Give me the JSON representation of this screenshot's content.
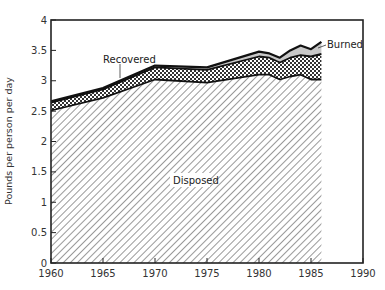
{
  "chart_data": {
    "type": "area",
    "stacked": true,
    "title": "",
    "xlabel": "",
    "ylabel": "Pounds per person per day",
    "xlim": [
      1960,
      1990
    ],
    "ylim": [
      0,
      4
    ],
    "x_ticks": [
      "1960",
      "1965",
      "1970",
      "1975",
      "1980",
      "1985",
      "1990"
    ],
    "y_ticks": [
      "0",
      "0.5",
      "1",
      "1.5",
      "2",
      "2.5",
      "3",
      "3.5",
      "4"
    ],
    "grid": false,
    "legend": "inline labels",
    "x": [
      1960,
      1965,
      1970,
      1975,
      1980,
      1981,
      1982,
      1983,
      1984,
      1985,
      1986
    ],
    "series": [
      {
        "name": "Disposed",
        "pattern": "diagonal-hatch",
        "values": [
          2.51,
          2.72,
          3.02,
          2.97,
          3.1,
          3.1,
          3.02,
          3.07,
          3.1,
          3.02,
          3.02
        ]
      },
      {
        "name": "Recovered",
        "pattern": "cross-hatch",
        "values": [
          0.13,
          0.14,
          0.2,
          0.21,
          0.3,
          0.28,
          0.28,
          0.31,
          0.32,
          0.38,
          0.42
        ]
      },
      {
        "name": "Burned",
        "pattern": "light-gray",
        "values": [
          0.02,
          0.02,
          0.03,
          0.04,
          0.08,
          0.07,
          0.08,
          0.12,
          0.16,
          0.12,
          0.2
        ]
      }
    ],
    "totals": [
      2.66,
      2.88,
      3.25,
      3.22,
      3.48,
      3.45,
      3.38,
      3.5,
      3.58,
      3.52,
      3.64
    ],
    "annotations": [
      {
        "text": "Recovered",
        "target_year": 1966
      },
      {
        "text": "Burned",
        "target_year": 1986
      },
      {
        "text": "Disposed",
        "position": "center of hatched area"
      }
    ]
  },
  "labels": {
    "ylabel": "Pounds per person per day",
    "recovered": "Recovered",
    "burned": "Burned",
    "disposed": "Disposed"
  },
  "colors": {
    "line": "#111111",
    "hatch": "#444444",
    "burned_fill": "#c8c8c8",
    "text": "#333333"
  }
}
